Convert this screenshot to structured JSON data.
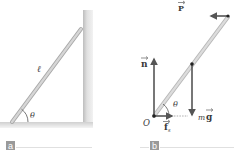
{
  "figure": {
    "panels": [
      {
        "id": "a",
        "label": "a",
        "symbols": {
          "length": "ℓ",
          "angle": "θ"
        }
      },
      {
        "id": "b",
        "label": "b",
        "symbols": {
          "force_P": "P",
          "normal": "n",
          "weight_m": "m",
          "weight_g": "g",
          "origin": "O",
          "friction_f": "f",
          "friction_sub": "s",
          "angle": "θ"
        }
      }
    ],
    "colors": {
      "ladder": "#c9c9c9",
      "ladder_edge": "#a8a8a8",
      "wall": "#e2e2e2",
      "wall_shadow": "#cfcfcf",
      "arrow": "#555555",
      "label_box": "#9a9a9a",
      "rule": "#d8d8d8"
    }
  }
}
